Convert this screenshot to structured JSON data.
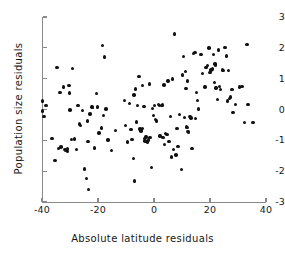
{
  "chart_data": {
    "type": "scatter",
    "title": "",
    "xlabel": "Absolute latitude residuals",
    "ylabel": "Population size residuals",
    "xlim": [
      -40,
      40
    ],
    "ylim": [
      -3,
      3
    ],
    "xticks": [
      -40,
      -20,
      0,
      20,
      40
    ],
    "xtick_labels": [
      "-40",
      "-20",
      "0",
      "20",
      "40"
    ],
    "yticks": [
      3,
      2,
      1,
      0,
      -1,
      -2,
      -3
    ],
    "ytick_labels": [
      "3",
      "2",
      "1",
      "0",
      "-1",
      "-2",
      "-3"
    ],
    "grid": false,
    "legend": false,
    "marker": {
      "shape": "circle",
      "color": "#111111",
      "size": 3.4
    },
    "axis_color": "#8a8a8a",
    "n_points": 152,
    "points": [
      [
        -39.8,
        0.27
      ],
      [
        -39.9,
        -0.05
      ],
      [
        -39.3,
        -0.22
      ],
      [
        -38.6,
        0.12
      ],
      [
        -36.4,
        -0.95
      ],
      [
        -35.4,
        -1.66
      ],
      [
        -34.6,
        1.37
      ],
      [
        -34.2,
        -1.27
      ],
      [
        -33.6,
        0.56
      ],
      [
        -33.2,
        -1.22
      ],
      [
        -32.4,
        0.73
      ],
      [
        -31.8,
        -1.3
      ],
      [
        -31.4,
        -1.33
      ],
      [
        -31.0,
        -1.36
      ],
      [
        -30.8,
        -1.28
      ],
      [
        -30.4,
        0.77
      ],
      [
        -30.2,
        0.54
      ],
      [
        -30.0,
        -0.02
      ],
      [
        -29.5,
        -0.97
      ],
      [
        -29.0,
        1.32
      ],
      [
        -28.4,
        -0.96
      ],
      [
        -27.6,
        -1.29
      ],
      [
        -27.2,
        0.13
      ],
      [
        -26.6,
        -0.47
      ],
      [
        -26.2,
        -0.52
      ],
      [
        -25.6,
        -0.04
      ],
      [
        -24.8,
        -1.93
      ],
      [
        -24.2,
        -2.23
      ],
      [
        -23.8,
        -0.37
      ],
      [
        -23.6,
        -1.03
      ],
      [
        -23.4,
        -2.6
      ],
      [
        -22.8,
        -0.15
      ],
      [
        -22.2,
        0.08
      ],
      [
        -22.0,
        0.07
      ],
      [
        -21.2,
        -1.25
      ],
      [
        -20.6,
        0.52
      ],
      [
        -20.2,
        0.08
      ],
      [
        -19.6,
        -0.76
      ],
      [
        -18.8,
        -0.6
      ],
      [
        -18.4,
        2.07
      ],
      [
        -18.0,
        -0.19
      ],
      [
        -17.6,
        1.7
      ],
      [
        -17.2,
        0.01
      ],
      [
        -16.4,
        -0.99
      ],
      [
        -15.2,
        -1.33
      ],
      [
        -13.8,
        -0.69
      ],
      [
        -10.6,
        0.29
      ],
      [
        -10.2,
        -0.52
      ],
      [
        -9.4,
        -1.05
      ],
      [
        -8.8,
        0.19
      ],
      [
        -8.2,
        -0.64
      ],
      [
        -7.8,
        -0.97
      ],
      [
        -7.4,
        -1.58
      ],
      [
        -7.2,
        0.47
      ],
      [
        -7.0,
        -2.32
      ],
      [
        -6.6,
        0.66
      ],
      [
        -6.2,
        -0.41
      ],
      [
        -5.8,
        0.13
      ],
      [
        -5.4,
        1.07
      ],
      [
        -5.0,
        -0.63
      ],
      [
        -4.8,
        -0.67
      ],
      [
        -4.6,
        -0.7
      ],
      [
        -4.4,
        -0.68
      ],
      [
        -4.2,
        0.77
      ],
      [
        -4.0,
        -0.61
      ],
      [
        -3.6,
        0.1
      ],
      [
        -3.4,
        -0.95
      ],
      [
        -3.2,
        -1.02
      ],
      [
        -2.8,
        -0.89
      ],
      [
        -2.4,
        -1.05
      ],
      [
        -2.0,
        -0.99
      ],
      [
        -1.6,
        0.83
      ],
      [
        -1.4,
        -0.9
      ],
      [
        -1.0,
        -1.89
      ],
      [
        -0.6,
        0.04
      ],
      [
        -0.2,
        -0.19
      ],
      [
        0.2,
        0.12
      ],
      [
        0.6,
        -0.33
      ],
      [
        1.0,
        -0.37
      ],
      [
        1.6,
        0.16
      ],
      [
        2.0,
        0.13
      ],
      [
        2.2,
        -0.86
      ],
      [
        2.6,
        0.12
      ],
      [
        3.0,
        0.15
      ],
      [
        3.2,
        -0.9
      ],
      [
        3.6,
        0.8
      ],
      [
        3.8,
        -1.14
      ],
      [
        4.2,
        -0.78
      ],
      [
        4.6,
        -0.81
      ],
      [
        5.0,
        0.93
      ],
      [
        5.4,
        -1.04
      ],
      [
        5.8,
        -0.22
      ],
      [
        6.2,
        -1.54
      ],
      [
        6.6,
        0.99
      ],
      [
        7.0,
        -1.3
      ],
      [
        7.4,
        2.45
      ],
      [
        7.8,
        -1.48
      ],
      [
        8.2,
        -0.61
      ],
      [
        8.6,
        -1.21
      ],
      [
        9.2,
        -0.16
      ],
      [
        9.8,
        -1.94
      ],
      [
        10.2,
        1.12
      ],
      [
        10.6,
        1.71
      ],
      [
        10.8,
        -0.26
      ],
      [
        11.2,
        1.24
      ],
      [
        11.4,
        0.68
      ],
      [
        11.6,
        -0.55
      ],
      [
        11.8,
        -0.58
      ],
      [
        12.0,
        0.92
      ],
      [
        12.2,
        -0.72
      ],
      [
        12.4,
        -0.75
      ],
      [
        12.8,
        -0.23
      ],
      [
        13.2,
        -0.27
      ],
      [
        13.6,
        -1.26
      ],
      [
        14.2,
        1.82
      ],
      [
        14.6,
        1.84
      ],
      [
        14.8,
        -0.3
      ],
      [
        15.2,
        0.55
      ],
      [
        15.6,
        0.3
      ],
      [
        16.0,
        0.02
      ],
      [
        16.8,
        1.78
      ],
      [
        17.4,
        1.16
      ],
      [
        18.2,
        0.73
      ],
      [
        18.6,
        1.36
      ],
      [
        19.2,
        1.42
      ],
      [
        19.6,
        2.0
      ],
      [
        20.0,
        1.2
      ],
      [
        20.4,
        1.28
      ],
      [
        20.8,
        1.33
      ],
      [
        21.0,
        1.3
      ],
      [
        21.2,
        1.78
      ],
      [
        21.6,
        0.88
      ],
      [
        21.8,
        1.47
      ],
      [
        22.0,
        1.44
      ],
      [
        22.2,
        0.7
      ],
      [
        22.6,
        0.33
      ],
      [
        23.0,
        1.93
      ],
      [
        23.4,
        0.75
      ],
      [
        23.8,
        0.64
      ],
      [
        24.4,
        1.28
      ],
      [
        24.8,
        1.26
      ],
      [
        25.4,
        2.02
      ],
      [
        25.8,
        1.74
      ],
      [
        26.2,
        0.27
      ],
      [
        26.6,
        1.26
      ],
      [
        27.0,
        0.36
      ],
      [
        27.4,
        0.4
      ],
      [
        27.8,
        0.64
      ],
      [
        28.2,
        -0.1
      ],
      [
        29.0,
        0.17
      ],
      [
        30.6,
        0.73
      ],
      [
        31.4,
        0.75
      ],
      [
        32.4,
        -0.42
      ],
      [
        33.2,
        2.11
      ],
      [
        33.6,
        0.16
      ],
      [
        35.4,
        -0.43
      ]
    ]
  }
}
